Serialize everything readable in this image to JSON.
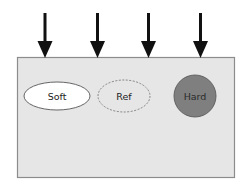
{
  "diagram": {
    "type": "indentation-test-schematic",
    "arrows": [
      {
        "name": "arrow-1",
        "x": 45
      },
      {
        "name": "arrow-2",
        "x": 97
      },
      {
        "name": "arrow-3",
        "x": 148
      },
      {
        "name": "arrow-4",
        "x": 200
      }
    ],
    "substrate": {
      "fill": "#e6e6e6",
      "stroke": "#8c8c8c"
    },
    "inclusions": [
      {
        "label": "Soft",
        "shape": "ellipse",
        "fill": "#ffffff",
        "stroke": "#555555",
        "stroke_style": "solid"
      },
      {
        "label": "Ref",
        "shape": "ellipse",
        "fill": "#e6e6e6",
        "stroke": "#777777",
        "stroke_style": "dashed"
      },
      {
        "label": "Hard",
        "shape": "circle",
        "fill": "#7f7f7f",
        "stroke": "#5a5a5a",
        "stroke_style": "solid"
      }
    ],
    "colors": {
      "arrow": "#111111",
      "text": "#222222"
    }
  }
}
